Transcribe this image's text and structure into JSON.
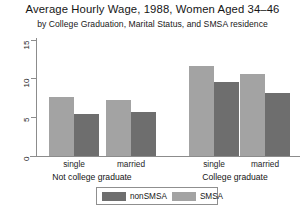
{
  "chart_data": {
    "type": "bar",
    "title": "Average Hourly Wage, 1988, Women Aged 34–46",
    "subtitle": "by College Graduation, Marital Status, and SMSA residence",
    "xlabel": "",
    "ylabel": "",
    "ylim": [
      0,
      15
    ],
    "yticks": [
      0,
      5,
      10,
      15
    ],
    "ytick_labels": [
      "0",
      "5",
      "10",
      "15"
    ],
    "grid": false,
    "legend_position": "bottom",
    "categories": [
      "single",
      "married",
      "single",
      "married"
    ],
    "group_labels": [
      "Not college graduate",
      "College graduate"
    ],
    "series": [
      {
        "name": "SMSA",
        "color": "#a3a3a3",
        "values": [
          7.7,
          7.2,
          11.7,
          10.6
        ]
      },
      {
        "name": "nonSMSA",
        "color": "#6e6e6e",
        "values": [
          5.4,
          5.7,
          9.6,
          8.1
        ]
      }
    ],
    "legend": [
      "nonSMSA",
      "SMSA"
    ]
  },
  "axis": {
    "ticks": [
      {
        "label": "15",
        "value": 15
      },
      {
        "label": "10",
        "value": 10
      },
      {
        "label": "5",
        "value": 5
      },
      {
        "label": "0",
        "value": 0
      }
    ]
  },
  "groups": [
    {
      "label": "Not college graduate",
      "cats": [
        "single",
        "married"
      ]
    },
    {
      "label": "College graduate",
      "cats": [
        "single",
        "married"
      ]
    }
  ],
  "legend": {
    "nonsmsa_label": "nonSMSA",
    "smsa_label": "SMSA"
  }
}
